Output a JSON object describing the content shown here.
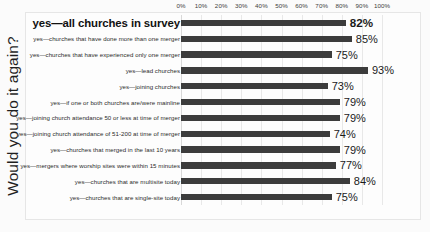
{
  "chart_data": {
    "type": "bar",
    "orientation": "horizontal",
    "title": "",
    "xlabel": "",
    "ylabel": "Would you do it again?",
    "xlim": [
      0,
      100
    ],
    "grid": true,
    "legend": null,
    "xticks": [
      "0%",
      "10%",
      "20%",
      "30%",
      "40%",
      "50%",
      "60%",
      "70%",
      "80%",
      "90%",
      "100%"
    ],
    "xtick_values": [
      0,
      10,
      20,
      30,
      40,
      50,
      60,
      70,
      80,
      90,
      100
    ],
    "bar_color": "#3c3c3c",
    "categories": [
      "yes—all churches in survey",
      "yes—churches that have done more than one merger",
      "yes—churches that have experienced only one merger",
      "yes—lead churches",
      "yes—joining churches",
      "yes—if one or both churches are/were mainline",
      "yes—joining church attendance 50 or less at time of merger",
      "yes—joining church attendance of 51-200 at time of merger",
      "yes—churches that merged in the last 10 years",
      "yes—mergers where worship sites were within 15 minutes",
      "yes—churches that are multisite today",
      "yes—churches that are single-site today"
    ],
    "values": [
      82,
      85,
      75,
      93,
      73,
      79,
      79,
      74,
      79,
      77,
      84,
      75
    ],
    "data_labels": [
      "82%",
      "85%",
      "75%",
      "93%",
      "73%",
      "79%",
      "79%",
      "74%",
      "79%",
      "77%",
      "84%",
      "75%"
    ],
    "emphasis_index": 0
  }
}
